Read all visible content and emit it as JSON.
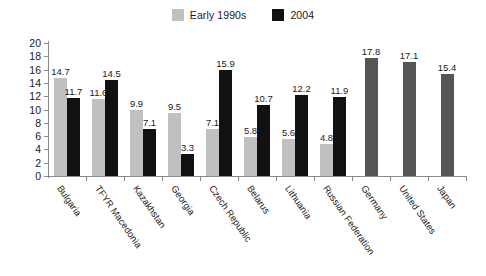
{
  "chart_data": {
    "type": "bar",
    "title": "",
    "subtitle": "",
    "xlabel": "",
    "ylabel": "",
    "ylim": [
      0,
      20
    ],
    "ytick_step": 2,
    "yticks": [
      "20",
      "18",
      "16",
      "14",
      "12",
      "10",
      "8",
      "6",
      "4",
      "2",
      "0"
    ],
    "grid": false,
    "legend_position": "top-center",
    "categories": [
      "Bulgaria",
      "TFYR Macedonia",
      "Kazakhstan",
      "Georgia",
      "Czech Republic",
      "Belarus",
      "Lithuania",
      "Russian Federation",
      "Germany",
      "United States",
      "Japan"
    ],
    "series": [
      {
        "name": "Early 1990s",
        "color": "#c0c0c0",
        "values": [
          14.7,
          11.6,
          9.9,
          9.5,
          7.1,
          5.8,
          5.6,
          4.8,
          null,
          null,
          null
        ],
        "labels": [
          "14.7",
          "11.6",
          "9.9",
          "9.5",
          "7.1",
          "5.8",
          "5.6",
          "4.8",
          "",
          "",
          ""
        ]
      },
      {
        "name": "2004",
        "color": "#111111",
        "values": [
          11.7,
          14.5,
          7.1,
          3.3,
          15.9,
          10.7,
          12.2,
          11.9,
          null,
          null,
          null
        ],
        "labels": [
          "11.7",
          "14.5",
          "7.1",
          "3.3",
          "15.9",
          "10.7",
          "12.2",
          "11.9",
          "",
          "",
          ""
        ]
      },
      {
        "name": "Reference",
        "color": "#555555",
        "values": [
          null,
          null,
          null,
          null,
          null,
          null,
          null,
          null,
          17.8,
          17.1,
          15.4
        ],
        "labels": [
          "",
          "",
          "",
          "",
          "",
          "",
          "",
          "",
          "17.8",
          "17.1",
          "15.4"
        ]
      }
    ],
    "legend": [
      {
        "label": "Early 1990s",
        "color": "#c0c0c0"
      },
      {
        "label": "2004",
        "color": "#111111"
      }
    ]
  }
}
